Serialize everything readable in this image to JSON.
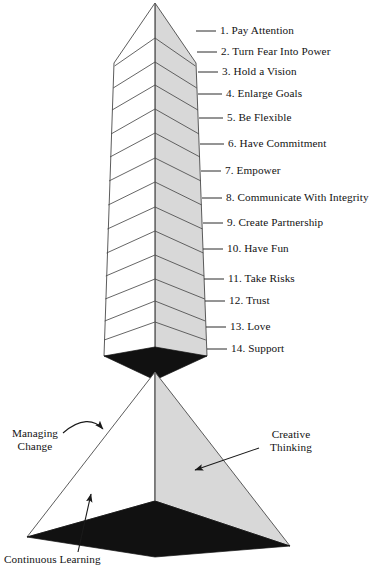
{
  "figure": {
    "title": "",
    "type": "obelisk-and-pyramid-diagram",
    "colors": {
      "face_light": "#ffffff",
      "face_shaded": "#d8d8d8",
      "base_dark": "#111111",
      "outline": "#4a4a4a",
      "text": "#121212",
      "background": "#ffffff"
    }
  },
  "obelisk": {
    "name": "stacked-principles-obelisk",
    "segment_count": 14,
    "labels": [
      {
        "number": "1.",
        "text": "Pay Attention",
        "full": "1. Pay Attention",
        "y": 30
      },
      {
        "number": "2.",
        "text": "Turn Fear Into Power",
        "full": "2. Turn Fear Into Power",
        "y": 51
      },
      {
        "number": "3.",
        "text": "Hold a Vision",
        "full": "3. Hold a Vision",
        "y": 71
      },
      {
        "number": "4.",
        "text": "Enlarge Goals",
        "full": "4. Enlarge Goals",
        "y": 93
      },
      {
        "number": "5.",
        "text": "Be Flexible",
        "full": "5. Be Flexible",
        "y": 117
      },
      {
        "number": "6.",
        "text": "Have Commitment",
        "full": "6. Have Commitment",
        "y": 143
      },
      {
        "number": "7.",
        "text": "Empower",
        "full": "7. Empower",
        "y": 170
      },
      {
        "number": "8.",
        "text": "Communicate With Integrity",
        "full": "8. Communicate With Integrity",
        "y": 197
      },
      {
        "number": "9.",
        "text": "Create Partnership",
        "full": "9. Create Partnership",
        "y": 222
      },
      {
        "number": "10.",
        "text": "Have Fun",
        "full": "10. Have Fun",
        "y": 248
      },
      {
        "number": "11.",
        "text": "Take Risks",
        "full": "11. Take Risks",
        "y": 278
      },
      {
        "number": "12.",
        "text": "Trust",
        "full": "12. Trust",
        "y": 300
      },
      {
        "number": "13.",
        "text": "Love",
        "full": "13. Love",
        "y": 326
      },
      {
        "number": "14.",
        "text": "Support",
        "full": "14. Support",
        "y": 348
      }
    ]
  },
  "pyramid": {
    "name": "foundation-pyramid",
    "annotations": [
      {
        "id": "managing-change",
        "line1": "Managing",
        "line2": "Change",
        "x": 6,
        "y": 427,
        "arrow": "curved-arrow-right"
      },
      {
        "id": "creative-thinking",
        "line1": "Creative",
        "line2": "Thinking",
        "x": 262,
        "y": 428,
        "arrow": "straight-arrow-down-left"
      },
      {
        "id": "continuous-learning",
        "line1": "Continuous Learning",
        "line2": "",
        "x": 4,
        "y": 553,
        "arrow": "straight-arrow-up-right",
        "clipped": true
      }
    ]
  }
}
